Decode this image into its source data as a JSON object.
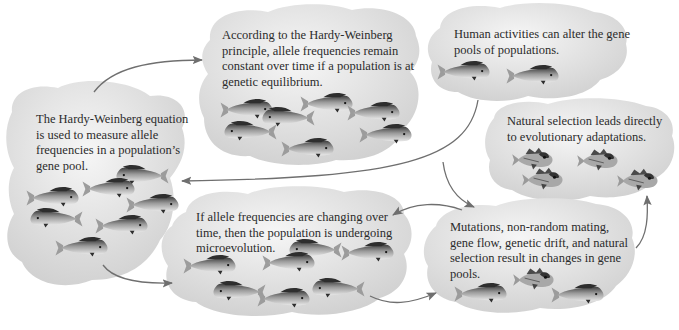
{
  "diagram": {
    "colors": {
      "bubble_light": "#f4f4f4",
      "bubble_dark": "#cfcfcf",
      "arrow": "#6f6f6f",
      "text": "#2b2b2b",
      "fish_body": "#8a8a8a",
      "fish_dark": "#2e2e2e"
    },
    "nodes": [
      {
        "id": "hw-equation",
        "text": "The Hardy-Weinberg equation is used to measure allele frequencies in a population’s gene pool.",
        "fish": {
          "type": "dolphinfish",
          "count": 7
        }
      },
      {
        "id": "hw-principle",
        "text": "According to the Hardy-Weinberg principle, allele frequencies remain constant over time if a population is at genetic equilibrium.",
        "fish": {
          "type": "dolphinfish",
          "count": 7
        }
      },
      {
        "id": "human-activities",
        "text": "Human activities can alter the gene pools of populations.",
        "fish": {
          "type": "dolphinfish",
          "count": 2
        }
      },
      {
        "id": "natural-selection",
        "text": "Natural selection leads directly to evolutionary adaptations.",
        "fish": {
          "type": "spiny-fish",
          "count": 4
        }
      },
      {
        "id": "microevolution",
        "text": "If allele frequencies are changing over time, then the population is undergoing microevolution.",
        "fish": {
          "type": "dolphinfish",
          "count": 7
        }
      },
      {
        "id": "mechanisms",
        "text": "Mutations, non-random mating, gene flow, genetic drift, and natural selection result in changes in gene pools.",
        "fish": {
          "type": "mixed",
          "count": 3
        }
      }
    ],
    "edges": [
      {
        "from": "hw-equation",
        "to": "hw-principle"
      },
      {
        "from": "hw-equation",
        "to": "microevolution"
      },
      {
        "from": "human-activities",
        "to": "hw-equation"
      },
      {
        "from": "human-activities",
        "to": "mechanisms"
      },
      {
        "from": "mechanisms",
        "to": "microevolution"
      },
      {
        "from": "microevolution",
        "to": "mechanisms"
      },
      {
        "from": "mechanisms",
        "to": "natural-selection"
      }
    ]
  }
}
